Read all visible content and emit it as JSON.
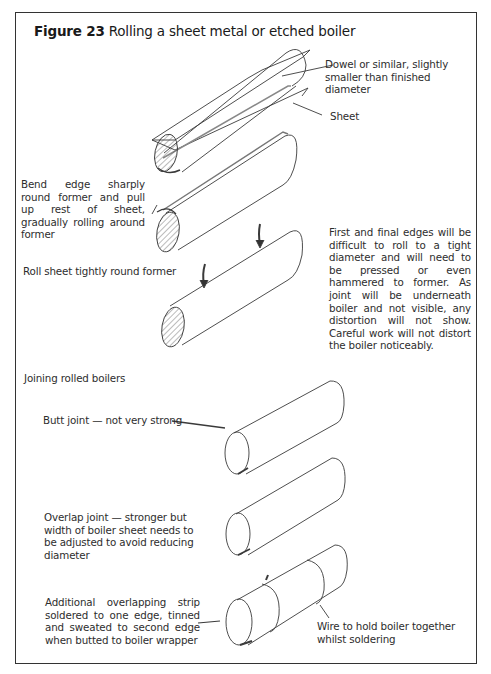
{
  "figure": {
    "number_label": "Figure 23",
    "title": "Rolling a sheet metal or etched boiler"
  },
  "labels": {
    "dowel": "Dowel or similar, slightly smaller than finished diameter",
    "sheet": "Sheet",
    "bend_edge": "Bend edge sharply round former and pull up rest of sheet, gradually rolling around former",
    "roll_tightly": "Roll sheet tightly round former",
    "first_final_edges": "First and final edges will be difficult to roll to a tight diameter and will need to be pressed or even hammered to former. As joint will be underneath boiler and not visible, any distortion will not show. Careful work will not distort the boiler noticeably.",
    "joining_heading": "Joining rolled boilers",
    "butt_joint": "Butt joint — not very strong",
    "overlap_joint": "Overlap joint — stronger but width of boiler sheet needs to be adjusted to avoid reducing diameter",
    "strip_joint": "Additional overlapping strip soldered to one edge, tinned and sweated to second edge when butted to boiler wrapper",
    "wire": "Wire to hold boiler together whilst soldering"
  },
  "colors": {
    "ink": "#2a2a2a",
    "frame": "#333333",
    "background": "#ffffff"
  }
}
